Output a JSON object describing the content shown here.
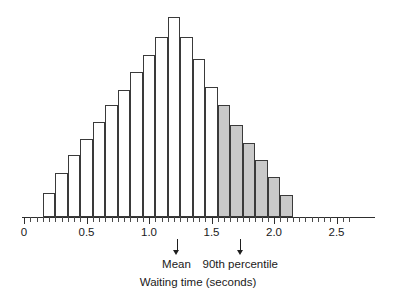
{
  "chart_data": {
    "type": "bar",
    "title": "",
    "subtitle": "",
    "xlabel": "Waiting time (seconds)",
    "ylabel": "",
    "xlim": [
      0,
      2.6
    ],
    "ylim": [
      0,
      210
    ],
    "grid": false,
    "legend_position": "none",
    "bin_width": 0.1,
    "x_tick_labels": [
      "0",
      "0.5",
      "1.0",
      "1.5",
      "2.0",
      "2.5"
    ],
    "x_tick_values": [
      0,
      0.5,
      1.0,
      1.5,
      2.0,
      2.5
    ],
    "minor_tick_step": 0.05,
    "bin_starts": [
      0.15,
      0.25,
      0.35,
      0.45,
      0.55,
      0.65,
      0.75,
      0.85,
      0.95,
      1.05,
      1.15,
      1.25,
      1.35,
      1.45,
      1.55,
      1.65,
      1.75,
      1.85,
      1.95,
      2.05
    ],
    "categories": [
      "0.15",
      "0.25",
      "0.35",
      "0.45",
      "0.55",
      "0.65",
      "0.75",
      "0.85",
      "0.95",
      "1.05",
      "1.15",
      "1.25",
      "1.35",
      "1.45",
      "1.55",
      "1.65",
      "1.75",
      "1.85",
      "1.95",
      "2.05"
    ],
    "values": [
      24,
      44,
      62,
      78,
      95,
      112,
      127,
      145,
      162,
      180,
      200,
      180,
      158,
      130,
      112,
      92,
      74,
      57,
      40,
      22
    ],
    "bar_shaded": [
      false,
      false,
      false,
      false,
      false,
      false,
      false,
      false,
      false,
      false,
      false,
      false,
      false,
      false,
      true,
      true,
      true,
      true,
      true,
      true
    ],
    "colors": {
      "bar_fill_unshaded": "#ffffff",
      "bar_fill_shaded": "#c9c9c9",
      "bar_outline": "#3a3a3a",
      "axis": "#2e2e2e",
      "text": "#1a1a1a",
      "background": "#ffffff"
    },
    "annotations": [
      {
        "name": "mean",
        "label": "Mean",
        "x_value": 1.22
      },
      {
        "name": "ninetieth-percentile",
        "label": "90th percentile",
        "x_value": 1.73
      }
    ]
  }
}
